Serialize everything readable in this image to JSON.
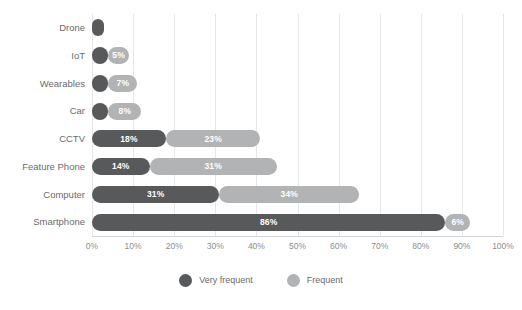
{
  "chart_data": {
    "type": "bar",
    "orientation": "horizontal",
    "stacked": true,
    "title": "",
    "xlabel": "",
    "ylabel": "",
    "xlim": [
      0,
      100
    ],
    "grid": true,
    "legend_position": "bottom",
    "categories": [
      "Drone",
      "IoT",
      "Wearables",
      "Car",
      "CCTV",
      "Feature Phone",
      "Computer",
      "Smartphone"
    ],
    "tick_labels": [
      "0%",
      "10%",
      "20%",
      "30%",
      "40%",
      "50%",
      "60%",
      "70%",
      "80%",
      "90%",
      "100%"
    ],
    "tick_values": [
      0,
      10,
      20,
      30,
      40,
      50,
      60,
      70,
      80,
      90,
      100
    ],
    "series": [
      {
        "name": "Very frequent",
        "color": "#58595B",
        "values": [
          3,
          4,
          4,
          4,
          18,
          14,
          31,
          86
        ],
        "labels": [
          "",
          "",
          "",
          "",
          "18%",
          "14%",
          "31%",
          "86%"
        ]
      },
      {
        "name": "Frequent",
        "color": "#B2B3B5",
        "values": [
          0,
          5,
          7,
          8,
          23,
          31,
          34,
          6
        ],
        "labels": [
          "",
          "5%",
          "7%",
          "8%",
          "23%",
          "31%",
          "34%",
          "6%"
        ]
      }
    ]
  },
  "legend": {
    "items": [
      {
        "label": "Very frequent",
        "color": "#58595B"
      },
      {
        "label": "Frequent",
        "color": "#B2B3B5"
      }
    ]
  }
}
